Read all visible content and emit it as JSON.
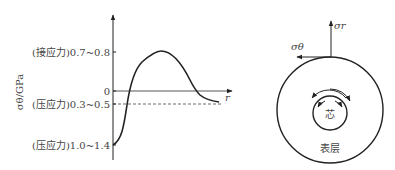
{
  "graph": {
    "y_axis_label": "σθ/GPa",
    "x_axis_label": "r",
    "ticks": [
      {
        "label": "(接应力) 0.7~0.8",
        "y": 52
      },
      {
        "label": "0",
        "y": 91
      },
      {
        "label": "(压应力) 0.3~0.5",
        "y": 104
      },
      {
        "label": "(压应力) 1.0~1.4",
        "y": 145
      }
    ],
    "tick_labels": {
      "t1": "(接应力)0.7~0.8",
      "t0": "0",
      "t2": "(压应力)0.3~0.5",
      "t3": "(压应力)1.0~1.4"
    }
  },
  "cross_section": {
    "sigma_r_label": "σr",
    "sigma_theta_label": "σθ",
    "core_label": "芯",
    "surface_label": "表层"
  },
  "colors": {
    "line": "#222222",
    "text": "#444444"
  }
}
